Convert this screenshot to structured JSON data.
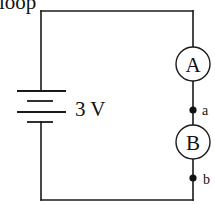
{
  "diagram": {
    "type": "circuit",
    "caption": "loop",
    "battery": {
      "label": "3 V",
      "plates": 4
    },
    "meters": [
      {
        "id": "A",
        "label": "A"
      },
      {
        "id": "B",
        "label": "B"
      }
    ],
    "nodes": [
      {
        "id": "a",
        "label": "a"
      },
      {
        "id": "b",
        "label": "b"
      }
    ],
    "colors": {
      "line": "#1a1a1a",
      "background": "#ffffff"
    }
  }
}
